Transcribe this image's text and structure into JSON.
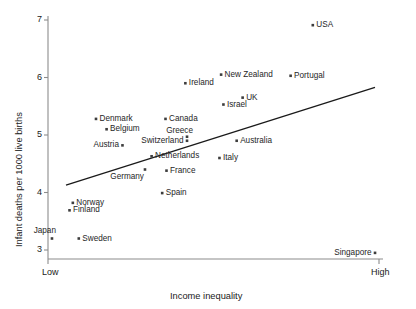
{
  "chart_data": {
    "type": "scatter",
    "title": "",
    "xlabel": "Income inequality",
    "ylabel": "Infant deaths per 1000 live births",
    "x_tick_labels": [
      "Low",
      "High"
    ],
    "y_tick_labels": [
      "3",
      "4",
      "5",
      "6",
      "7"
    ],
    "ylim": [
      2.85,
      7.1
    ],
    "grid": false,
    "legend": null,
    "axis_color": "#8c8c8c",
    "point_color": "#3d3d3d",
    "line_color": "#1a1a1a",
    "trend_line": {
      "label": "regression line",
      "x_start_frac": 0.0,
      "y_start": 4.13,
      "x_end_frac": 1.0,
      "y_end": 5.83
    },
    "points": [
      {
        "name": "USA",
        "x_frac": 0.8,
        "y": 6.91,
        "label_side": "right"
      },
      {
        "name": "New Zealand",
        "x_frac": 0.523,
        "y": 6.05,
        "label_side": "right"
      },
      {
        "name": "Portugal",
        "x_frac": 0.733,
        "y": 6.03,
        "label_side": "right"
      },
      {
        "name": "Ireland",
        "x_frac": 0.415,
        "y": 5.9,
        "label_side": "right"
      },
      {
        "name": "UK",
        "x_frac": 0.588,
        "y": 5.65,
        "label_side": "right"
      },
      {
        "name": "Israel",
        "x_frac": 0.53,
        "y": 5.53,
        "label_side": "right"
      },
      {
        "name": "Denmark",
        "x_frac": 0.145,
        "y": 5.28,
        "label_side": "right"
      },
      {
        "name": "Canada",
        "x_frac": 0.355,
        "y": 5.28,
        "label_side": "right"
      },
      {
        "name": "Belgium",
        "x_frac": 0.177,
        "y": 5.1,
        "label_side": "right"
      },
      {
        "name": "Greece",
        "x_frac": 0.42,
        "y": 4.97,
        "label_side": "above-right"
      },
      {
        "name": "Switzerland",
        "x_frac": 0.42,
        "y": 4.9,
        "label_side": "left"
      },
      {
        "name": "Australia",
        "x_frac": 0.57,
        "y": 4.9,
        "label_side": "right"
      },
      {
        "name": "Austria",
        "x_frac": 0.225,
        "y": 4.82,
        "label_side": "left"
      },
      {
        "name": "Netherlands",
        "x_frac": 0.313,
        "y": 4.63,
        "label_side": "right"
      },
      {
        "name": "Italy",
        "x_frac": 0.518,
        "y": 4.6,
        "label_side": "right"
      },
      {
        "name": "France",
        "x_frac": 0.358,
        "y": 4.38,
        "label_side": "right"
      },
      {
        "name": "Germany",
        "x_frac": 0.293,
        "y": 4.4,
        "label_side": "below-left"
      },
      {
        "name": "Spain",
        "x_frac": 0.345,
        "y": 3.99,
        "label_side": "right"
      },
      {
        "name": "Norway",
        "x_frac": 0.075,
        "y": 3.82,
        "label_side": "right"
      },
      {
        "name": "Finland",
        "x_frac": 0.065,
        "y": 3.69,
        "label_side": "right"
      },
      {
        "name": "Sweden",
        "x_frac": 0.093,
        "y": 3.2,
        "label_side": "right"
      },
      {
        "name": "Japan",
        "x_frac": 0.012,
        "y": 3.2,
        "label_side": "above-left"
      },
      {
        "name": "Singapore",
        "x_frac": 0.988,
        "y": 2.95,
        "label_side": "left"
      }
    ]
  }
}
